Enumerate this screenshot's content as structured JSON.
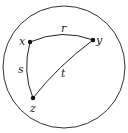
{
  "diagram": {
    "type": "curved triangle inscribed in circle",
    "boundary": {
      "cx": 64,
      "cy": 67,
      "r": 61,
      "stroke": "#333333"
    },
    "vertices": [
      {
        "id": "x",
        "label": "x",
        "px": 30,
        "py": 42
      },
      {
        "id": "y",
        "label": "y",
        "px": 93,
        "py": 40
      },
      {
        "id": "z",
        "label": "z",
        "px": 33,
        "py": 98
      }
    ],
    "edges": [
      {
        "from": "x",
        "to": "y",
        "label": "r"
      },
      {
        "from": "x",
        "to": "z",
        "label": "s"
      },
      {
        "from": "y",
        "to": "z",
        "label": "t"
      }
    ]
  },
  "labels": {
    "x": "x",
    "y": "y",
    "z": "z",
    "r": "r",
    "s": "s",
    "t": "t"
  }
}
